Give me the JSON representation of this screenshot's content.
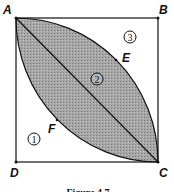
{
  "diagram": {
    "points": {
      "A": "A",
      "B": "B",
      "C": "C",
      "D": "D",
      "E": "E",
      "F": "F"
    },
    "regions": {
      "r1": "1",
      "r2": "2",
      "r3": "3"
    },
    "caption": "Figure 4.7",
    "colors": {
      "shade": "#9a9a9a",
      "stroke": "#111111"
    }
  }
}
